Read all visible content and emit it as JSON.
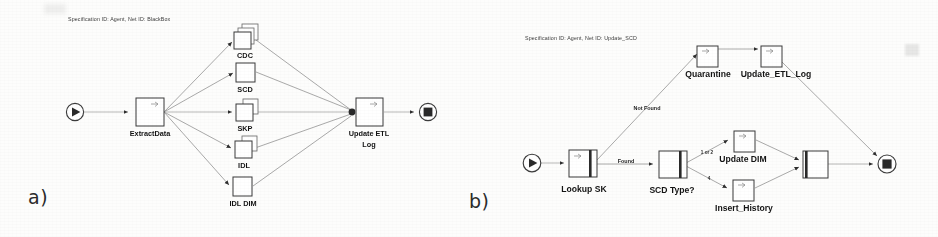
{
  "figure": {
    "panels": [
      {
        "id": "a",
        "caption": "a)",
        "spec_label": "Specification ID: Agent, Net ID: BlackBox",
        "start_node": {
          "name": "start-node",
          "icon": "play-circle-icon"
        },
        "end_node": {
          "name": "end-node",
          "icon": "stop-circle-icon"
        },
        "nodes": [
          {
            "id": "extract-data",
            "label": "ExtractData",
            "icon": "task-node-icon"
          },
          {
            "id": "cdc",
            "label": "CDC",
            "icon": "stacked-task-icon"
          },
          {
            "id": "scd",
            "label": "SCD",
            "icon": "task-node-icon"
          },
          {
            "id": "skp",
            "label": "SKP",
            "icon": "stacked-task-icon"
          },
          {
            "id": "idl",
            "label": "IDL",
            "icon": "stacked-task-icon"
          },
          {
            "id": "idl-dim",
            "label": "IDL DIM",
            "icon": "task-node-icon"
          },
          {
            "id": "update-etl-log",
            "label_line1": "Update ETL",
            "label_line2": "Log",
            "icon": "task-node-icon"
          }
        ],
        "edge_labels": []
      },
      {
        "id": "b",
        "caption": "b)",
        "spec_label": "Specification ID: Agent, Net ID: Update_SCD",
        "start_node": {
          "name": "start-node",
          "icon": "play-circle-icon"
        },
        "end_node": {
          "name": "end-node",
          "icon": "stop-circle-icon"
        },
        "nodes": [
          {
            "id": "lookup-sk",
            "label": "Lookup SK",
            "icon": "subnet-task-icon"
          },
          {
            "id": "scd-type",
            "label": "SCD Type?",
            "icon": "subnet-task-icon"
          },
          {
            "id": "quarantine",
            "label": "Quarantine",
            "icon": "task-node-icon"
          },
          {
            "id": "update-etl-log",
            "label": "Update_ETL_Log",
            "icon": "task-node-icon"
          },
          {
            "id": "update-dim",
            "label": "Update DIM",
            "icon": "task-node-icon"
          },
          {
            "id": "insert-history",
            "label": "Insert_History",
            "icon": "task-node-icon"
          },
          {
            "id": "merge",
            "label": "",
            "icon": "merge-task-icon"
          }
        ],
        "edge_labels": [
          {
            "id": "not-found",
            "text": "Not Found"
          },
          {
            "id": "found",
            "text": "Found"
          },
          {
            "id": "one-or-two",
            "text": "1 or 2"
          },
          {
            "id": "four",
            "text": "4"
          }
        ]
      }
    ]
  },
  "colors": {
    "page_background": "#fdfdfc",
    "stroke": "#3a3a3a",
    "wire": "#8d8d8d",
    "text": "#141414",
    "solid_fill": "#2a2a2a"
  }
}
